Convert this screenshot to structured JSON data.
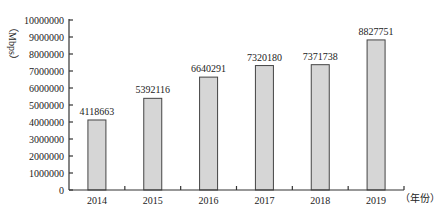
{
  "chart_data": {
    "type": "bar",
    "title": "",
    "xlabel": "（年份）",
    "ylabel": "（Mbps）",
    "categories": [
      "2014",
      "2015",
      "2016",
      "2017",
      "2018",
      "2019"
    ],
    "values": [
      4118663,
      5392116,
      6640291,
      7320180,
      7371738,
      8827751
    ],
    "value_labels": [
      "4118663",
      "5392116",
      "6640291",
      "7320180",
      "7371738",
      "8827751"
    ],
    "ylim": [
      0,
      10000000
    ],
    "yticks": [
      "0",
      "1000000",
      "2000000",
      "3000000",
      "4000000",
      "5000000",
      "6000000",
      "7000000",
      "8000000",
      "9000000",
      "10000000"
    ],
    "grid": false,
    "legend": "none",
    "bar_color": "#d6d6d6",
    "bar_edge_color": "#444444"
  }
}
